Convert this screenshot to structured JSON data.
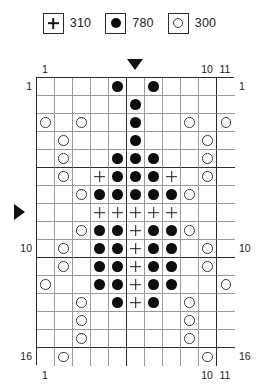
{
  "legend": {
    "entries": [
      {
        "symbol": "plus",
        "icon_name": "plus-symbol-icon",
        "count": "310"
      },
      {
        "symbol": "dot",
        "icon_name": "filled-circle-icon",
        "count": "780"
      },
      {
        "symbol": "ring",
        "icon_name": "open-circle-icon",
        "count": "300"
      }
    ]
  },
  "markers": {
    "top_arrow_column": 6,
    "left_arrow_row": 8,
    "top_arrow_name": "top-center-marker-icon",
    "left_arrow_name": "left-center-marker-icon"
  },
  "axes": {
    "columns": 11,
    "rows": 16,
    "top_labels": [
      {
        "col": 1,
        "text": "1"
      },
      {
        "col": 10,
        "text": "10"
      },
      {
        "col": 11,
        "text": "11"
      }
    ],
    "bottom_labels": [
      {
        "col": 1,
        "text": "1"
      },
      {
        "col": 10,
        "text": "10"
      },
      {
        "col": 11,
        "text": "11"
      }
    ],
    "left_labels": [
      {
        "row": 1,
        "text": "1"
      },
      {
        "row": 10,
        "text": "10"
      },
      {
        "row": 16,
        "text": "16"
      }
    ],
    "right_labels": [
      {
        "row": 1,
        "text": "1"
      },
      {
        "row": 10,
        "text": "10"
      },
      {
        "row": 16,
        "text": "16"
      }
    ],
    "heavy_every": 5
  },
  "colors": {
    "grid_line": "#9a9a9a",
    "grid_heavy": "#2b2b2b",
    "symbol_fill": "#0d0d0d",
    "symbol_stroke": "#3a3a3a",
    "background": "#ffffff"
  },
  "chart_data": {
    "type": "grid-pattern",
    "title": "",
    "columns": 11,
    "rows": 16,
    "symbols": {
      "plus": "+",
      "dot": "filled circle",
      "ring": "open circle",
      "empty": ""
    },
    "counts": {
      "plus": 310,
      "dot": 780,
      "ring": 300
    },
    "cells": [
      [
        "",
        "",
        "",
        "",
        "dot",
        "",
        "dot",
        "",
        "",
        "",
        ""
      ],
      [
        "",
        "",
        "",
        "",
        "",
        "dot",
        "",
        "",
        "",
        "",
        ""
      ],
      [
        "ring",
        "",
        "ring",
        "",
        "",
        "dot",
        "",
        "",
        "ring",
        "",
        "ring"
      ],
      [
        "",
        "ring",
        "",
        "",
        "",
        "dot",
        "",
        "",
        "",
        "ring",
        ""
      ],
      [
        "",
        "ring",
        "",
        "",
        "dot",
        "dot",
        "dot",
        "",
        "",
        "ring",
        ""
      ],
      [
        "",
        "ring",
        "",
        "plus",
        "dot",
        "dot",
        "dot",
        "plus",
        "",
        "ring",
        ""
      ],
      [
        "",
        "",
        "ring",
        "dot",
        "dot",
        "dot",
        "dot",
        "dot",
        "ring",
        "",
        ""
      ],
      [
        "",
        "",
        "",
        "plus",
        "plus",
        "plus",
        "plus",
        "plus",
        "",
        "",
        ""
      ],
      [
        "",
        "",
        "ring",
        "dot",
        "dot",
        "plus",
        "dot",
        "dot",
        "ring",
        "",
        ""
      ],
      [
        "",
        "ring",
        "",
        "dot",
        "dot",
        "plus",
        "dot",
        "dot",
        "",
        "ring",
        ""
      ],
      [
        "",
        "ring",
        "",
        "dot",
        "dot",
        "plus",
        "dot",
        "dot",
        "",
        "ring",
        ""
      ],
      [
        "ring",
        "",
        "",
        "dot",
        "dot",
        "plus",
        "dot",
        "dot",
        "",
        "",
        "ring"
      ],
      [
        "",
        "",
        "ring",
        "",
        "dot",
        "plus",
        "dot",
        "",
        "ring",
        "",
        ""
      ],
      [
        "",
        "",
        "ring",
        "",
        "",
        "",
        "",
        "",
        "ring",
        "",
        ""
      ],
      [
        "",
        "",
        "ring",
        "",
        "",
        "",
        "",
        "",
        "ring",
        "",
        ""
      ],
      [
        "",
        "ring",
        "",
        "",
        "",
        "",
        "",
        "",
        "",
        "ring",
        ""
      ]
    ]
  }
}
